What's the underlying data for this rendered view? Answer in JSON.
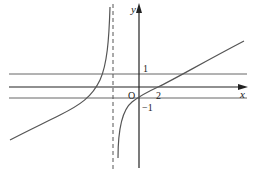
{
  "diagram": {
    "type": "function-graph",
    "axes": {
      "x_label": "x",
      "y_label": "y",
      "origin_label": "O"
    },
    "tick_labels": {
      "y_pos": "1",
      "y_neg": "−1",
      "x_pos": "2"
    },
    "horizontal_lines": [
      "y = 1",
      "y = −1"
    ],
    "vertical_asymptote": "dashed line",
    "curves": [
      "left branch",
      "right branch"
    ],
    "colors": {
      "axis": "#222222",
      "curve": "#555555",
      "guide_lines": "#666666"
    }
  }
}
